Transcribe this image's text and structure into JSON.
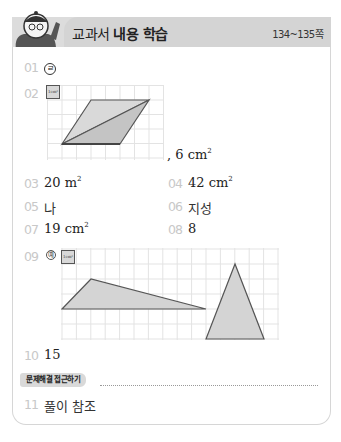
{
  "header": {
    "title_prefix": "교과서",
    "title_bold": "내용 학습",
    "pages": "134~135쪽",
    "mascot_icon": "mascot-character"
  },
  "answers": [
    {
      "num": "01",
      "text": "㉣",
      "circled": "㉣"
    },
    {
      "num": "02",
      "text": ", 6 cm",
      "sup": "2",
      "unit_box": "1cm²",
      "figure": {
        "type": "parallelogram-on-grid",
        "grid_cols": 8,
        "grid_rows": 5
      }
    },
    {
      "num": "03",
      "text": "20 m",
      "sup": "2"
    },
    {
      "num": "04",
      "text": "42 cm",
      "sup": "2"
    },
    {
      "num": "05",
      "text": "나"
    },
    {
      "num": "06",
      "text": "지성"
    },
    {
      "num": "07",
      "text": "19 cm",
      "sup": "2"
    },
    {
      "num": "08",
      "text": "8"
    },
    {
      "num": "09",
      "prefix": "예",
      "unit_box": "1cm²",
      "figure": {
        "type": "two-triangles-on-grid",
        "grid_cols": 15,
        "grid_rows": 6
      }
    },
    {
      "num": "10",
      "text": "15"
    },
    {
      "num": "11",
      "text": "풀이 참조"
    }
  ],
  "section": {
    "badge": "문제해결 접근하기"
  },
  "colors": {
    "header_bg": "#d4d4d4",
    "shape_fill": "#d0d0d0",
    "shape_stroke": "#555555",
    "grid_line": "#e2e2e2",
    "number_gray": "#c8c8c8"
  }
}
